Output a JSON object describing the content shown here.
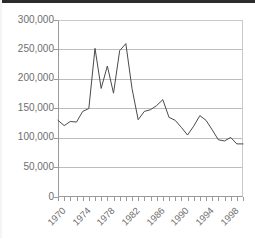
{
  "chart_data": {
    "type": "line",
    "title": "",
    "subtitle": "",
    "xlabel": "",
    "ylabel": "",
    "xlim": [
      1970,
      2000
    ],
    "ylim": [
      0,
      300000
    ],
    "grid": true,
    "legend": null,
    "y_ticks": [
      0,
      50000,
      100000,
      150000,
      200000,
      250000,
      300000
    ],
    "y_tick_labels": [
      "0",
      "50,000",
      "100,000",
      "150,000",
      "200,000",
      "250,000",
      "300,000"
    ],
    "x_ticks": [
      1970,
      1971,
      1972,
      1973,
      1974,
      1975,
      1976,
      1977,
      1978,
      1979,
      1980,
      1981,
      1982,
      1983,
      1984,
      1985,
      1986,
      1987,
      1988,
      1989,
      1990,
      1991,
      1992,
      1993,
      1994,
      1995,
      1996,
      1997,
      1998,
      1999,
      2000
    ],
    "x_tick_labels": [
      "1970",
      "1974",
      "1978",
      "1982",
      "1986",
      "1990",
      "1994",
      "1998"
    ],
    "x_labeled_ticks": [
      1970,
      1974,
      1978,
      1982,
      1986,
      1990,
      1994,
      1998
    ],
    "line_color": "#4a4a4a",
    "grid_color": "#bdbdbd",
    "axis_color": "#9a9a9a",
    "label_color": "#6e6e6e",
    "background": "#ffffff",
    "x": [
      1970,
      1971,
      1972,
      1973,
      1974,
      1975,
      1976,
      1977,
      1978,
      1979,
      1980,
      1981,
      1982,
      1983,
      1984,
      1985,
      1986,
      1987,
      1988,
      1989,
      1990,
      1991,
      1992,
      1993,
      1994,
      1995,
      1996,
      1997,
      1998,
      1999,
      2000
    ],
    "values": [
      130000,
      121000,
      128000,
      127000,
      145000,
      150000,
      252000,
      184000,
      222000,
      176000,
      248000,
      260000,
      184000,
      131000,
      145000,
      148000,
      155000,
      165000,
      135000,
      130000,
      118000,
      105000,
      120000,
      138000,
      130000,
      114000,
      97000,
      95000,
      101000,
      90000,
      90000
    ]
  }
}
